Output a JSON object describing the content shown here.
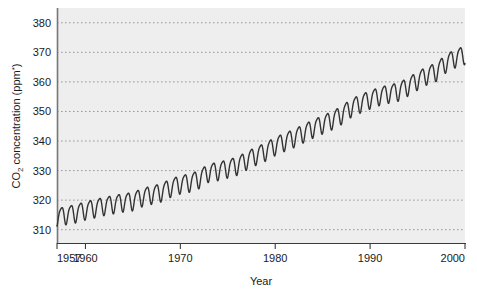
{
  "chart_data": {
    "type": "line",
    "title": "",
    "xlabel": "Year",
    "ylabel_main": "CO",
    "ylabel_sub": "2",
    "ylabel_rest": " concentration (ppm",
    "ylabel_sup": "*",
    "ylabel_close": ")",
    "ylabel_full": "CO2 concentration (ppm*)",
    "xlim": [
      1957,
      2000
    ],
    "ylim": [
      305.5,
      385
    ],
    "grid": true,
    "legend": "none",
    "y_ticks": [
      380,
      370,
      360,
      350,
      340,
      330,
      320,
      310
    ],
    "x_ticks": [
      1957,
      1960,
      1970,
      1980,
      1990,
      2000
    ],
    "series": [
      {
        "name": "Atmospheric CO2 (Mauna Loa)",
        "color": "#333333",
        "description": "Monthly mean atmospheric carbon dioxide concentration showing seasonal oscillation superimposed on a rising trend (Keeling Curve)",
        "annual_trend": [
          {
            "year": 1957,
            "value": 314.5
          },
          {
            "year": 1958,
            "value": 315.3
          },
          {
            "year": 1959,
            "value": 315.9
          },
          {
            "year": 1960,
            "value": 316.9
          },
          {
            "year": 1961,
            "value": 317.6
          },
          {
            "year": 1962,
            "value": 318.4
          },
          {
            "year": 1963,
            "value": 319.0
          },
          {
            "year": 1964,
            "value": 319.6
          },
          {
            "year": 1965,
            "value": 320.0
          },
          {
            "year": 1966,
            "value": 321.4
          },
          {
            "year": 1967,
            "value": 322.2
          },
          {
            "year": 1968,
            "value": 323.0
          },
          {
            "year": 1969,
            "value": 324.6
          },
          {
            "year": 1970,
            "value": 325.7
          },
          {
            "year": 1971,
            "value": 326.3
          },
          {
            "year": 1972,
            "value": 327.5
          },
          {
            "year": 1973,
            "value": 329.7
          },
          {
            "year": 1974,
            "value": 330.2
          },
          {
            "year": 1975,
            "value": 331.1
          },
          {
            "year": 1976,
            "value": 332.0
          },
          {
            "year": 1977,
            "value": 333.8
          },
          {
            "year": 1978,
            "value": 335.4
          },
          {
            "year": 1979,
            "value": 336.8
          },
          {
            "year": 1980,
            "value": 338.7
          },
          {
            "year": 1981,
            "value": 340.1
          },
          {
            "year": 1982,
            "value": 341.4
          },
          {
            "year": 1983,
            "value": 343.0
          },
          {
            "year": 1984,
            "value": 344.6
          },
          {
            "year": 1985,
            "value": 346.0
          },
          {
            "year": 1986,
            "value": 347.4
          },
          {
            "year": 1987,
            "value": 349.2
          },
          {
            "year": 1988,
            "value": 351.6
          },
          {
            "year": 1989,
            "value": 353.1
          },
          {
            "year": 1990,
            "value": 354.4
          },
          {
            "year": 1991,
            "value": 355.6
          },
          {
            "year": 1992,
            "value": 356.4
          },
          {
            "year": 1993,
            "value": 357.1
          },
          {
            "year": 1994,
            "value": 358.8
          },
          {
            "year": 1995,
            "value": 360.8
          },
          {
            "year": 1996,
            "value": 362.6
          },
          {
            "year": 1997,
            "value": 363.8
          },
          {
            "year": 1998,
            "value": 366.7
          },
          {
            "year": 1999,
            "value": 368.4
          },
          {
            "year": 2000,
            "value": 369.5
          }
        ],
        "seasonal_amplitude": 3.0
      }
    ]
  },
  "colors": {
    "plot_background": "#eeeeee",
    "page_background": "#ffffff",
    "gridline": "#9a9a9a",
    "axis": "#555555",
    "line": "#333333",
    "text": "#1a1a1a"
  }
}
